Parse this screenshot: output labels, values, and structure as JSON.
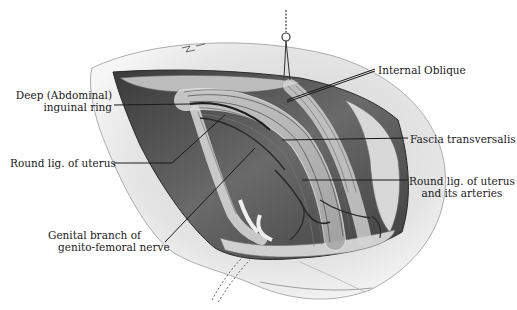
{
  "figure": {
    "colors": {
      "background": "#ffffff",
      "skin": "#e6e6e6",
      "cavity": "#4a4a4a",
      "fat": "#d9d9d9",
      "fibers": "#8c8c8c",
      "ink": "#1a1a1a"
    }
  },
  "labels": {
    "deep_ring": {
      "line1": "Deep (Abdominal)",
      "line2": "inguinal ring"
    },
    "round_lig": {
      "line1": "Round lig. of uterus"
    },
    "genital_branch": {
      "line1": "Genital branch of",
      "line2": "genito-femoral nerve"
    },
    "internal_oblique": {
      "line1": "Internal Oblique"
    },
    "fascia_transversalis": {
      "line1": "Fascia transversalis"
    },
    "round_lig_arteries": {
      "line1": "Round lig. of uterus",
      "line2": "and its arteries"
    }
  }
}
